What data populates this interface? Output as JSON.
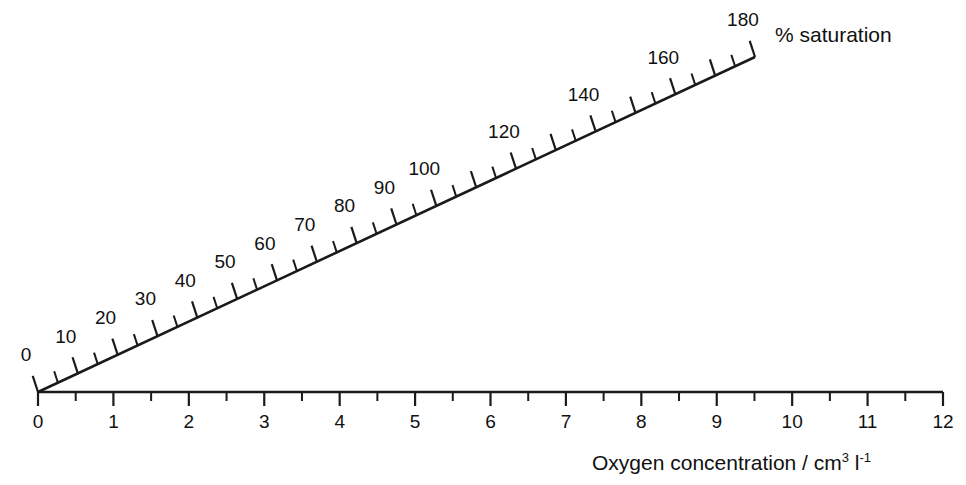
{
  "figure": {
    "type": "nomogram",
    "background": "#ffffff",
    "ink_color": "#1a1a1a"
  },
  "chart_data": {
    "type": "line",
    "title": "",
    "subtitle": "",
    "xlabel": "Oxygen concentration / cm3 l-1",
    "ylabel": "% saturation",
    "grid": false,
    "legend": "none",
    "origin_px": [
      38,
      392
    ],
    "series": [
      {
        "name": "oxygen-concentration-axis",
        "orientation": "horizontal",
        "units": "cm3 l-1",
        "range": [
          0,
          12
        ],
        "major_step": 1,
        "minor_step": 0.5,
        "end_px": [
          943,
          392
        ],
        "tick_values": [
          0,
          0.5,
          1,
          1.5,
          2,
          2.5,
          3,
          3.5,
          4,
          4.5,
          5,
          5.5,
          6,
          6.5,
          7,
          7.5,
          8,
          8.5,
          9,
          9.5,
          10,
          10.5,
          11,
          11.5,
          12
        ],
        "labeled_values": [
          0,
          1,
          2,
          3,
          4,
          5,
          6,
          7,
          8,
          9,
          10,
          11,
          12
        ],
        "tick_labels": [
          "0",
          "1",
          "2",
          "3",
          "4",
          "5",
          "6",
          "7",
          "8",
          "9",
          "10",
          "11",
          "12"
        ]
      },
      {
        "name": "percent-saturation-axis",
        "orientation": "diagonal",
        "units": "%",
        "range": [
          0,
          180
        ],
        "major_step": 10,
        "minor_step": 5,
        "angle_degrees": 25,
        "end_px": [
          755,
          57
        ],
        "tick_values": [
          0,
          5,
          10,
          15,
          20,
          25,
          30,
          35,
          40,
          45,
          50,
          55,
          60,
          65,
          70,
          75,
          80,
          85,
          90,
          95,
          100,
          105,
          110,
          115,
          120,
          125,
          130,
          135,
          140,
          145,
          150,
          155,
          160,
          165,
          170,
          175,
          180
        ],
        "labeled_values": [
          0,
          10,
          20,
          30,
          40,
          50,
          60,
          70,
          80,
          90,
          100,
          120,
          140,
          160,
          180
        ],
        "tick_labels": [
          "0",
          "10",
          "20",
          "30",
          "40",
          "50",
          "60",
          "70",
          "80",
          "90",
          "100",
          "120",
          "140",
          "160",
          "180"
        ]
      }
    ]
  },
  "labels": {
    "saturation_axis_title": "% saturation",
    "concentration_axis_title_main": "Oxygen concentration / cm",
    "concentration_axis_title_sup1": "3",
    "concentration_axis_title_mid": " l",
    "concentration_axis_title_sup2": "-1"
  }
}
